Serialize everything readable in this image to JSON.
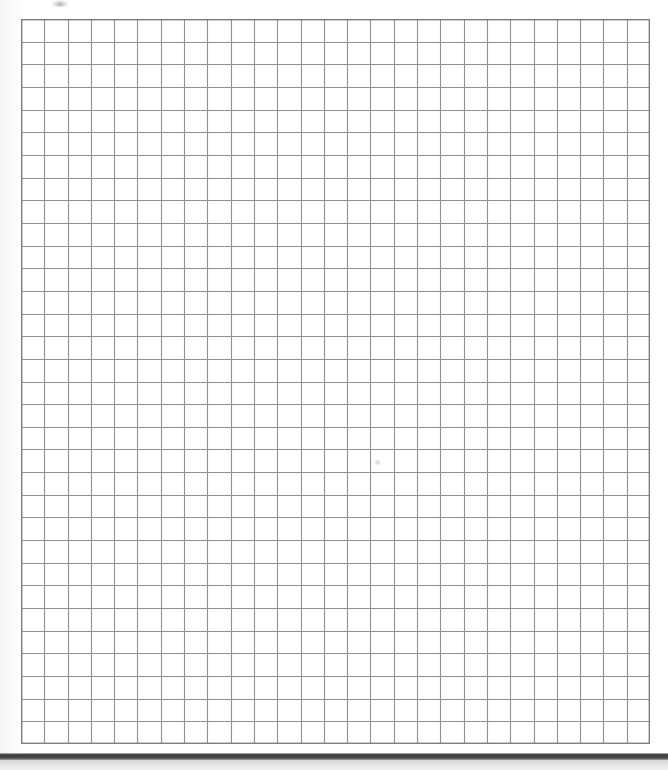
{
  "document": {
    "title": "Scanned grid paper page",
    "kind": "blank-graph-paper-scan",
    "page_width_px": 668,
    "page_height_px": 770,
    "background_color": "#ffffff"
  },
  "grid": {
    "name": "graph-paper-grid",
    "columns": 27,
    "rows": 32,
    "origin_x_px": 21,
    "origin_y_px": 19,
    "width_px": 629,
    "height_px": 725,
    "cell_width_px": 23.3,
    "cell_height_px": 22.65,
    "line_color": "#8f8f8f",
    "border_color": "#7d7d7d",
    "line_width_px": 1.1,
    "border_width_px": 1.4,
    "cell_fill_color": "#ffffff",
    "content": ""
  },
  "artifacts": {
    "top_smudge": {
      "name": "scan-smudge-top",
      "x_px": 52,
      "y_px": 0,
      "width_px": 16,
      "height_px": 7,
      "color": "#6e6e6e"
    },
    "center_dot": {
      "name": "scan-speck-center",
      "x_px": 374,
      "y_px": 459,
      "width_px": 7,
      "height_px": 7,
      "color": "#969696"
    }
  },
  "bottom_bar": {
    "name": "page-edge-dark-bar",
    "x_px": 0,
    "y_px": 753,
    "width_px": 668,
    "height_px": 7,
    "color": "#3c3c3c",
    "shadow_color": "#d5d5d5",
    "shadow_height_px": 10
  }
}
